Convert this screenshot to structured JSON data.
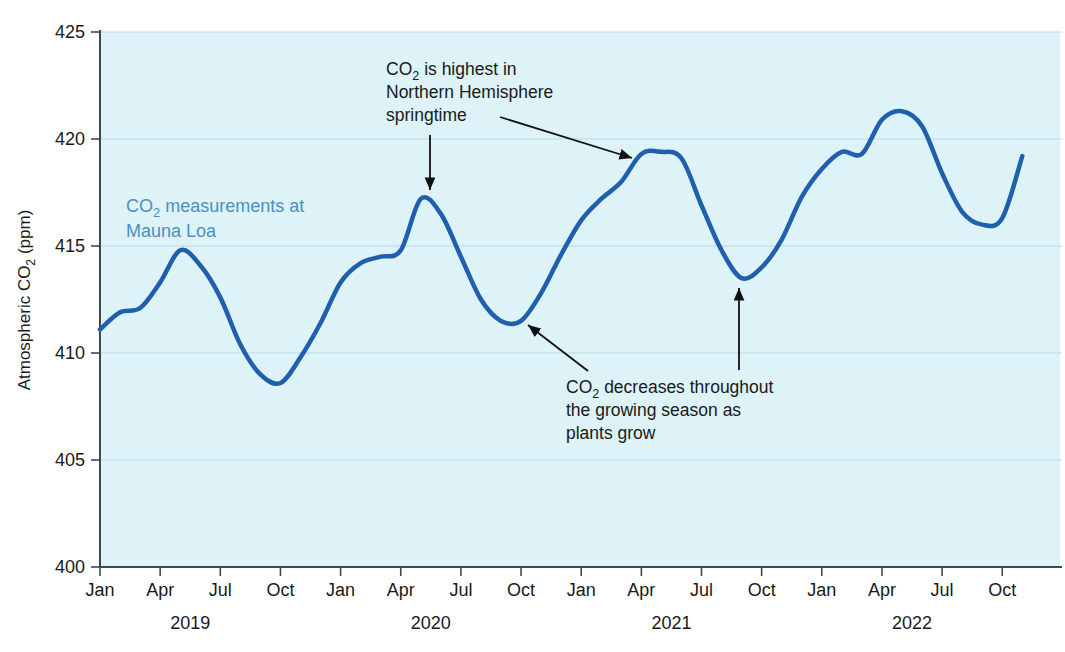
{
  "chart_data": {
    "type": "line",
    "title": "",
    "xlabel": "",
    "ylabel": "Atmospheric CO₂ (ppm)",
    "ylim": [
      400,
      425
    ],
    "ytick_labels": [
      "400",
      "405",
      "410",
      "415",
      "420",
      "425"
    ],
    "ytick_values": [
      400,
      405,
      410,
      415,
      420,
      425
    ],
    "grid": true,
    "legend_position": "inside-upper-left",
    "xtick_labels": [
      "Jan",
      "Apr",
      "Jul",
      "Oct",
      "Jan",
      "Apr",
      "Jul",
      "Oct",
      "Jan",
      "Apr",
      "Jul",
      "Oct",
      "Jan",
      "Apr",
      "Jul",
      "Oct"
    ],
    "x_group_labels": [
      "2019",
      "2020",
      "2021",
      "2022"
    ],
    "series": [
      {
        "name": "CO₂ measurements at Mauna Loa",
        "color": "#1f5fae",
        "x": [
          "2019-01",
          "2019-02",
          "2019-03",
          "2019-04",
          "2019-05",
          "2019-06",
          "2019-07",
          "2019-08",
          "2019-09",
          "2019-10",
          "2019-11",
          "2019-12",
          "2020-01",
          "2020-02",
          "2020-03",
          "2020-04",
          "2020-05",
          "2020-06",
          "2020-07",
          "2020-08",
          "2020-09",
          "2020-10",
          "2020-11",
          "2020-12",
          "2021-01",
          "2021-02",
          "2021-03",
          "2021-04",
          "2021-05",
          "2021-06",
          "2021-07",
          "2021-08",
          "2021-09",
          "2021-10",
          "2021-11",
          "2021-12",
          "2022-01",
          "2022-02",
          "2022-03",
          "2022-04",
          "2022-05",
          "2022-06",
          "2022-07",
          "2022-08",
          "2022-09",
          "2022-10",
          "2022-11"
        ],
        "values": [
          411.1,
          411.9,
          412.1,
          413.3,
          414.8,
          414.1,
          412.6,
          410.4,
          409.0,
          408.6,
          409.8,
          411.4,
          413.3,
          414.2,
          414.5,
          414.8,
          417.2,
          416.5,
          414.5,
          412.5,
          411.5,
          411.5,
          412.8,
          414.6,
          416.2,
          417.2,
          418.0,
          419.3,
          419.4,
          419.1,
          416.9,
          414.8,
          413.5,
          414.0,
          415.3,
          417.3,
          418.6,
          419.4,
          419.3,
          420.9,
          421.3,
          420.6,
          418.4,
          416.6,
          416.0,
          416.3,
          419.2
        ]
      }
    ],
    "annotations": [
      {
        "id": "spring-peak",
        "lines": [
          "CO₂ is highest in",
          "Northern Hemisphere",
          "springtime"
        ],
        "arrow_targets": [
          "2020 springtime maximum",
          "2021 springtime maximum"
        ]
      },
      {
        "id": "growing-season",
        "lines": [
          "CO₂ decreases throughout",
          "the growing season as",
          "plants grow"
        ],
        "arrow_targets": [
          "2020 autumn minimum",
          "2021 autumn minimum"
        ]
      }
    ],
    "series_label": {
      "line1": "CO₂ measurements at",
      "line2": "Mauna Loa",
      "color": "#4a90c4"
    },
    "plot_background": "#ddf3f7",
    "gridline_color": "#b9d9e8"
  }
}
